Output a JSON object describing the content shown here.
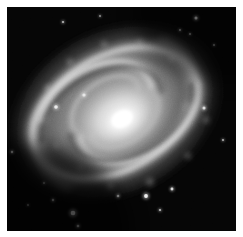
{
  "view": {
    "title": "Spiral Galaxy Image",
    "background_color": "#ffffff",
    "frame": {
      "x": 7,
      "y": 7,
      "width": 229,
      "height": 224
    },
    "image_kind": "astronomical-photograph",
    "color_mode": "grayscale"
  },
  "image": {
    "subject": "spiral galaxy",
    "sky_color": "#050505",
    "core_color": "#ffffff",
    "bulge_color": "#f2f2f2",
    "disk_color": "#8a8a8a",
    "arm_color": "#bdbdbd",
    "dust_color": "#3a3a3a",
    "halo_color": "#6a6a6a"
  },
  "chart_data": {
    "type": "heatmap",
    "xlabel": "",
    "ylabel": "",
    "center": {
      "x": 115,
      "y": 112
    },
    "disk": {
      "position_angle_deg": -28,
      "semi_major_px": 118,
      "semi_minor_px": 86
    },
    "bulge": {
      "semi_major_px": 44,
      "semi_minor_px": 31,
      "angle_deg": -28
    },
    "core": {
      "radius_px": 13,
      "peak_intensity": 255
    },
    "arms": [
      {
        "name": "arm-north-east",
        "start_deg": 10,
        "sweep_deg": 250,
        "pitch": 0.22,
        "brightness": 205
      },
      {
        "name": "arm-south-west",
        "start_deg": 190,
        "sweep_deg": 250,
        "pitch": 0.22,
        "brightness": 198
      }
    ],
    "dust_lanes": [
      {
        "name": "dust-inner-east",
        "brightness": 55
      },
      {
        "name": "dust-inner-west",
        "brightness": 50
      }
    ],
    "stars": [
      {
        "x": 73,
        "y": 213,
        "r": 2.3,
        "brightness": 250
      },
      {
        "x": 53,
        "y": 200,
        "r": 1.2,
        "brightness": 190
      },
      {
        "x": 78,
        "y": 226,
        "r": 1.3,
        "brightness": 200
      },
      {
        "x": 44,
        "y": 183,
        "r": 1.0,
        "brightness": 170
      },
      {
        "x": 28,
        "y": 205,
        "r": 0.9,
        "brightness": 150
      },
      {
        "x": 196,
        "y": 18,
        "r": 1.5,
        "brightness": 215
      },
      {
        "x": 180,
        "y": 30,
        "r": 1.0,
        "brightness": 170
      },
      {
        "x": 190,
        "y": 34,
        "r": 0.9,
        "brightness": 160
      },
      {
        "x": 214,
        "y": 45,
        "r": 0.9,
        "brightness": 150
      },
      {
        "x": 56,
        "y": 107,
        "r": 1.8,
        "brightness": 235
      },
      {
        "x": 84,
        "y": 95,
        "r": 1.6,
        "brightness": 230
      },
      {
        "x": 146,
        "y": 196,
        "r": 1.9,
        "brightness": 240
      },
      {
        "x": 172,
        "y": 189,
        "r": 1.4,
        "brightness": 215
      },
      {
        "x": 204,
        "y": 108,
        "r": 1.5,
        "brightness": 220
      },
      {
        "x": 118,
        "y": 196,
        "r": 1.3,
        "brightness": 205
      },
      {
        "x": 63,
        "y": 22,
        "r": 1.1,
        "brightness": 180
      },
      {
        "x": 12,
        "y": 152,
        "r": 1.2,
        "brightness": 190
      },
      {
        "x": 223,
        "y": 140,
        "r": 1.0,
        "brightness": 175
      },
      {
        "x": 100,
        "y": 16,
        "r": 0.9,
        "brightness": 150
      },
      {
        "x": 160,
        "y": 210,
        "r": 1.1,
        "brightness": 185
      }
    ],
    "knots": [
      {
        "x": 40,
        "y": 120,
        "r": 4,
        "brightness": 190
      },
      {
        "x": 48,
        "y": 88,
        "r": 5,
        "brightness": 195
      },
      {
        "x": 70,
        "y": 62,
        "r": 5,
        "brightness": 190
      },
      {
        "x": 104,
        "y": 44,
        "r": 5,
        "brightness": 185
      },
      {
        "x": 140,
        "y": 42,
        "r": 5,
        "brightness": 180
      },
      {
        "x": 172,
        "y": 58,
        "r": 5,
        "brightness": 185
      },
      {
        "x": 198,
        "y": 84,
        "r": 5,
        "brightness": 180
      },
      {
        "x": 206,
        "y": 120,
        "r": 5,
        "brightness": 175
      },
      {
        "x": 188,
        "y": 156,
        "r": 5,
        "brightness": 185
      },
      {
        "x": 150,
        "y": 182,
        "r": 6,
        "brightness": 195
      },
      {
        "x": 110,
        "y": 186,
        "r": 5,
        "brightness": 185
      },
      {
        "x": 80,
        "y": 168,
        "r": 4,
        "brightness": 175
      },
      {
        "x": 56,
        "y": 146,
        "r": 4,
        "brightness": 170
      }
    ],
    "intensity_range": [
      0,
      255
    ],
    "grid": false,
    "legend": "none"
  }
}
